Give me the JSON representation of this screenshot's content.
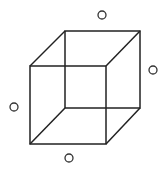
{
  "diagram": {
    "type": "wireframe-cube",
    "stroke_color": "#222222",
    "background": "#ffffff",
    "front_face": {
      "x1": 30,
      "y1": 66,
      "x2": 106,
      "y2": 144
    },
    "back_face": {
      "x1": 65,
      "y1": 31,
      "x2": 140,
      "y2": 108
    },
    "circles": [
      {
        "cx": 102,
        "cy": 15,
        "r": 4
      },
      {
        "cx": 153,
        "cy": 70,
        "r": 4
      },
      {
        "cx": 14,
        "cy": 107,
        "r": 4
      },
      {
        "cx": 69,
        "cy": 158,
        "r": 4
      }
    ]
  }
}
